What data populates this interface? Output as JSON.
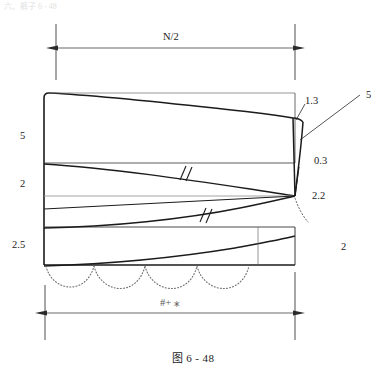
{
  "figure": {
    "caption": "图 6 - 48",
    "page_residue": "六、裤子 6 - 48"
  },
  "dimensions": {
    "top": {
      "label": "N/2",
      "x1": 56,
      "x2": 295,
      "y": 48
    },
    "bottom": {
      "label": "#+ ⁎",
      "x1": 45,
      "x2": 295,
      "y": 313
    }
  },
  "left_labels": [
    {
      "text": "5",
      "x": 20,
      "y": 131
    },
    {
      "text": "2",
      "x": 20,
      "y": 179
    },
    {
      "text": "2.5",
      "x": 12,
      "y": 240
    }
  ],
  "right_labels": [
    {
      "text": "1.3",
      "x": 305,
      "y": 96
    },
    {
      "text": "5",
      "x": 366,
      "y": 90
    },
    {
      "text": "0.3",
      "x": 314,
      "y": 156
    },
    {
      "text": "2.2",
      "x": 312,
      "y": 191
    },
    {
      "text": "2",
      "x": 341,
      "y": 242
    }
  ],
  "geometry": {
    "left_edge_x": 44,
    "right_edge_x": 295,
    "top_y": 93,
    "bottom_y": 265,
    "horizontal_lines_y": [
      163,
      196,
      227,
      265
    ],
    "convergence_point": {
      "x": 295,
      "y": 196
    },
    "scallop_count": 3,
    "tick_marks": 2
  },
  "colors": {
    "ink": "#1b1b1b",
    "thin": "#2a2a2a",
    "light": "#8d8d8d",
    "dotted": "#6f6f6f"
  }
}
